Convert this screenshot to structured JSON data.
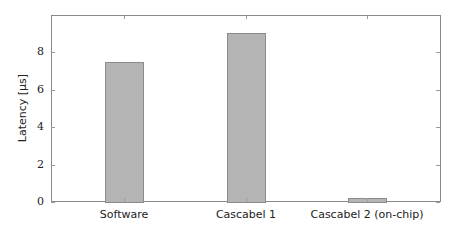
{
  "chart_data": {
    "type": "bar",
    "title": "",
    "xlabel": "",
    "ylabel": "Latency [µs]",
    "categories": [
      "Software",
      "Cascabel 1",
      "Cascabel 2 (on-chip)"
    ],
    "values": [
      7.45,
      9.0,
      0.2
    ],
    "ylim": [
      0,
      9.8
    ],
    "yticks": [
      0,
      2,
      4,
      6,
      8
    ],
    "grid": false,
    "legend": null,
    "bar_color": "#b4b4b4",
    "bar_edge_color": "#8c8c8c"
  },
  "axis": {
    "ylabel": "Latency [µs]",
    "yticks": [
      "0",
      "2",
      "4",
      "6",
      "8"
    ],
    "xticks": [
      "Software",
      "Cascabel 1",
      "Cascabel 2 (on-chip)"
    ]
  }
}
